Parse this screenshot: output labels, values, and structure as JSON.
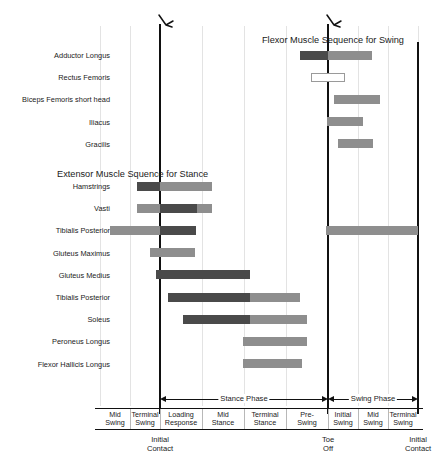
{
  "chart_data": {
    "type": "bar",
    "subtitle": "",
    "xlabel": "",
    "ylabel": "",
    "grid": true,
    "legend_position": "none",
    "xlim": [
      0,
      100
    ],
    "sections": [
      {
        "title": "Flexor Muscle Sequence for Swing",
        "rows": [
          {
            "label": "Adductor Longus",
            "segments": [
              {
                "start": 300,
                "end": 328,
                "shade": "dark"
              },
              {
                "start": 328,
                "end": 372,
                "shade": "mid"
              }
            ]
          },
          {
            "label": "Rectus Femoris",
            "segments": [
              {
                "start": 311,
                "end": 345,
                "shade": "open"
              }
            ]
          },
          {
            "label": "Biceps Femoris short head",
            "segments": [
              {
                "start": 334,
                "end": 380,
                "shade": "mid"
              }
            ]
          },
          {
            "label": "Iliacus",
            "segments": [
              {
                "start": 327,
                "end": 363,
                "shade": "mid"
              }
            ]
          },
          {
            "label": "Gracilis",
            "segments": [
              {
                "start": 338,
                "end": 373,
                "shade": "mid"
              }
            ]
          }
        ]
      },
      {
        "title": "Extensor Muscle Squence for Stance",
        "rows": [
          {
            "label": "Hamstrings",
            "segments": [
              {
                "start": 137,
                "end": 160,
                "shade": "dark"
              },
              {
                "start": 160,
                "end": 212,
                "shade": "mid"
              }
            ]
          },
          {
            "label": "Vasti",
            "segments": [
              {
                "start": 137,
                "end": 160,
                "shade": "mid"
              },
              {
                "start": 160,
                "end": 197,
                "shade": "dark"
              },
              {
                "start": 197,
                "end": 212,
                "shade": "mid"
              }
            ]
          },
          {
            "label": "Tibialis Posterior",
            "segments": [
              {
                "start": 110,
                "end": 160,
                "shade": "mid"
              },
              {
                "start": 160,
                "end": 196,
                "shade": "dark"
              },
              {
                "start": 326,
                "end": 418,
                "shade": "mid"
              }
            ]
          },
          {
            "label": "Gluteus Maximus",
            "segments": [
              {
                "start": 150,
                "end": 195,
                "shade": "mid"
              }
            ]
          },
          {
            "label": "Gluteus Medius",
            "segments": [
              {
                "start": 156,
                "end": 250,
                "shade": "dark"
              }
            ]
          },
          {
            "label": "Tibialis Posterior",
            "segments": [
              {
                "start": 168,
                "end": 250,
                "shade": "dark"
              },
              {
                "start": 250,
                "end": 300,
                "shade": "mid"
              }
            ]
          },
          {
            "label": "Soleus",
            "segments": [
              {
                "start": 183,
                "end": 250,
                "shade": "dark"
              },
              {
                "start": 250,
                "end": 307,
                "shade": "mid"
              }
            ]
          },
          {
            "label": "Peroneus Longus",
            "segments": [
              {
                "start": 243,
                "end": 307,
                "shade": "mid"
              }
            ]
          },
          {
            "label": "Flexor Hallicis Longus",
            "segments": [
              {
                "start": 243,
                "end": 302,
                "shade": "mid"
              }
            ]
          }
        ]
      }
    ],
    "phase_bands": [
      {
        "label": "Stance Phase",
        "start": 160,
        "end": 328
      },
      {
        "label": "Swing Phase",
        "start": 328,
        "end": 418
      }
    ],
    "tick_labels": [
      {
        "line1": "Mid",
        "line2": "Swing",
        "start": 100,
        "end": 130
      },
      {
        "line1": "Terminal",
        "line2": "Swing",
        "start": 130,
        "end": 160
      },
      {
        "line1": "Loading",
        "line2": "Response",
        "start": 160,
        "end": 202
      },
      {
        "line1": "Mid",
        "line2": "Stance",
        "start": 202,
        "end": 244
      },
      {
        "line1": "Terminal",
        "line2": "Stance",
        "start": 244,
        "end": 286
      },
      {
        "line1": "Pre-",
        "line2": "Swing",
        "start": 286,
        "end": 328
      },
      {
        "line1": "Initial",
        "line2": "Swing",
        "start": 328,
        "end": 358
      },
      {
        "line1": "Mid",
        "line2": "Swing",
        "start": 358,
        "end": 388
      },
      {
        "line1": "Terminal",
        "line2": "Swing",
        "start": 388,
        "end": 418
      }
    ],
    "events": [
      {
        "line1": "Initial",
        "line2": "Contact",
        "x": 160
      },
      {
        "line1": "Toe",
        "line2": "Off",
        "x": 328
      },
      {
        "line1": "Initial",
        "line2": "Contact",
        "x": 418
      }
    ],
    "gridlines": [
      100,
      130,
      160,
      202,
      244,
      286,
      328,
      358,
      388,
      418
    ],
    "event_lines": [
      160,
      328,
      418
    ],
    "colors": {
      "dark": "#4a4a4a",
      "mid": "#8e8e8e",
      "light": "#a8a8a8",
      "open_border": "#9a9a9a",
      "grid": "#e3e3e3",
      "axis": "#111111"
    }
  }
}
